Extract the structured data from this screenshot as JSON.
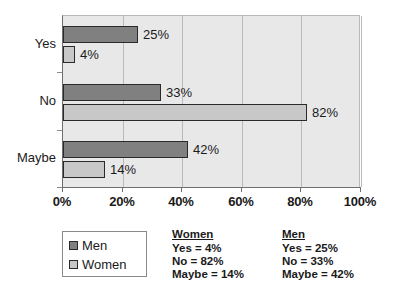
{
  "chart_data": {
    "type": "bar",
    "orientation": "horizontal",
    "title": "",
    "xlabel": "",
    "ylabel": "",
    "categories": [
      "Yes",
      "No",
      "Maybe"
    ],
    "series": [
      {
        "name": "Men",
        "color": "#808080",
        "values": [
          25,
          33,
          42
        ]
      },
      {
        "name": "Women",
        "color": "#c8c8c8",
        "values": [
          4,
          82,
          14
        ]
      }
    ],
    "xlim": [
      0,
      100
    ],
    "xticks": [
      0,
      20,
      40,
      60,
      80,
      100
    ],
    "xtick_labels": [
      "0%",
      "20%",
      "40%",
      "60%",
      "80%",
      "100%"
    ],
    "grid": true,
    "legend_position": "bottom-left",
    "data_labels": {
      "Men": [
        "25%",
        "33%",
        "42%"
      ],
      "Women": [
        "4%",
        "82%",
        "14%"
      ]
    },
    "plot_background": "#e8e8e8"
  },
  "legend": {
    "items": [
      {
        "label": "Men",
        "color": "#808080"
      },
      {
        "label": "Women",
        "color": "#c8c8c8"
      }
    ]
  },
  "summary": {
    "women": {
      "heading": "Women",
      "lines": [
        "Yes = 4%",
        "No = 82%",
        "Maybe = 14%"
      ]
    },
    "men": {
      "heading": "Men",
      "lines": [
        "Yes = 25%",
        "No = 33%",
        "Maybe = 42%"
      ]
    }
  }
}
